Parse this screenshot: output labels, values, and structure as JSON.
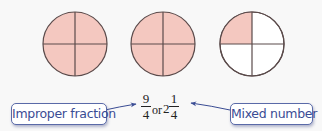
{
  "diagram": {
    "colors": {
      "shaded": "#f4c8c0",
      "unshaded": "#ffffff",
      "stroke": "#5a4a4a",
      "label_text": "#3a4c94",
      "label_border": "#5a6aa8",
      "arrow": "#3a4c94"
    },
    "circles": [
      {
        "name": "whole-1",
        "parts": 4,
        "shaded_parts": 4
      },
      {
        "name": "whole-2",
        "parts": 4,
        "shaded_parts": 4
      },
      {
        "name": "quarter",
        "parts": 4,
        "shaded_parts": 1
      }
    ],
    "expression": {
      "improper": {
        "numerator": "9",
        "denominator": "4"
      },
      "connector": "or",
      "mixed": {
        "whole": "2",
        "numerator": "1",
        "denominator": "4"
      }
    },
    "labels": {
      "left": "Improper fraction",
      "right": "Mixed number"
    }
  }
}
